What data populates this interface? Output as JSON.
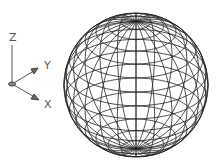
{
  "ucs_icon": {
    "z_label": "Z",
    "y_label": "Y",
    "x_label": "X"
  },
  "model": {
    "object": "sphere",
    "display": "wireframe"
  }
}
